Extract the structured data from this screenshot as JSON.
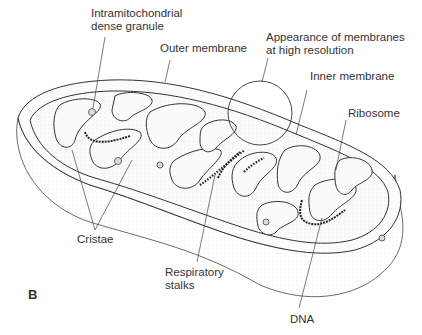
{
  "figure": {
    "panel_label": "B"
  },
  "labels": {
    "granule_line1": "Intramitochondrial",
    "granule_line2": "dense granule",
    "outer_membrane": "Outer membrane",
    "appearance_line1": "Appearance of membranes",
    "appearance_line2": "at high resolution",
    "inner_membrane": "Inner membrane",
    "ribosome": "Ribosome",
    "cristae": "Cristae",
    "respiratory_line1": "Respiratory",
    "respiratory_line2": "stalks",
    "dna": "DNA"
  }
}
